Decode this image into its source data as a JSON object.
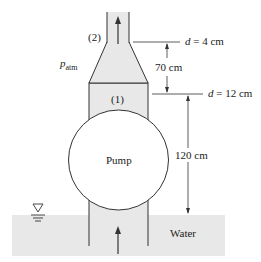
{
  "figure": {
    "labels": {
      "section2": "(2)",
      "section1": "(1)",
      "patm_symbol": "p",
      "patm_sub": "atm",
      "pump": "Pump",
      "water": "Water"
    },
    "dimensions": {
      "d_top_var": "d",
      "d_top_val": " = 4 cm",
      "d_bottom_var": "d",
      "d_bottom_val": " = 12 cm",
      "height_cone": "70 cm",
      "height_total": "120 cm"
    },
    "icons": [
      "flow-arrow-up",
      "water-surface-symbol"
    ],
    "colors": {
      "fill": "#e8e8e8",
      "line": "#333333",
      "background": "#ffffff"
    }
  }
}
